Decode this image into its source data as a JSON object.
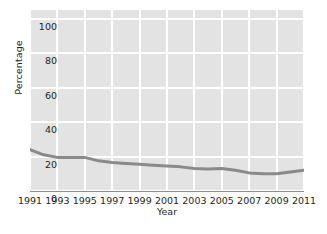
{
  "chart_data": {
    "type": "line",
    "title": "",
    "subtitle": "",
    "xlabel": "Year",
    "ylabel": "Percentage",
    "xlim": [
      1991,
      2011
    ],
    "ylim": [
      0,
      105
    ],
    "grid": true,
    "legend": null,
    "legend_position": "none",
    "x_tick_labels": [
      "1991",
      "1993",
      "1995",
      "1997",
      "1999",
      "2001",
      "2003",
      "2005",
      "2007",
      "2009",
      "2011"
    ],
    "x_tick_values": [
      1991,
      1993,
      1995,
      1997,
      1999,
      2001,
      2003,
      2005,
      2007,
      2009,
      2011
    ],
    "y_tick_labels": [
      "0",
      "20",
      "40",
      "60",
      "80",
      "100"
    ],
    "y_tick_values": [
      0,
      20,
      40,
      60,
      80,
      100
    ],
    "x": [
      1991,
      1992,
      1993,
      1994,
      1995,
      1996,
      1997,
      1998,
      1999,
      2000,
      2001,
      2002,
      2003,
      2004,
      2005,
      2006,
      2007,
      2008,
      2009,
      2010,
      2011
    ],
    "values": [
      24,
      21,
      19.5,
      19.5,
      19.5,
      17.5,
      16.5,
      16,
      15.5,
      15,
      14.5,
      14,
      13,
      12.8,
      13,
      12,
      10.5,
      10,
      10,
      11,
      12
    ],
    "series_color": "#8a8a8a",
    "panel_background": "#e3e3e3",
    "grid_color": "#ffffff",
    "axis_color": "#8d8d8d",
    "text_color": "#231f20"
  }
}
